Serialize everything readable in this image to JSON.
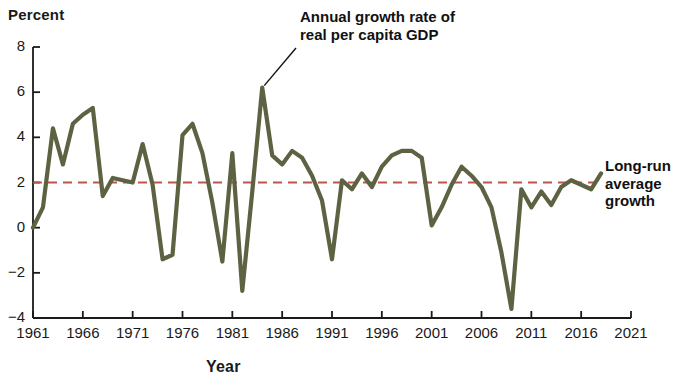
{
  "figure": {
    "ylabel": "Percent",
    "xlabel": "Year",
    "annotations": {
      "series_label": "Annual growth rate of\nreal per capita GDP",
      "average_label": "Long-run\naverage\ngrowth"
    },
    "colors": {
      "series_line": "#5d6342",
      "average_line": "#c0544a",
      "axis": "#1a1a1a",
      "background": "#ffffff",
      "text": "#111111"
    }
  },
  "chart_data": {
    "type": "line",
    "title": "",
    "xlabel": "Year",
    "ylabel": "Percent",
    "xlim": [
      1961,
      2021
    ],
    "ylim": [
      -4,
      8
    ],
    "yticks": [
      -4,
      -2,
      0,
      2,
      4,
      6,
      8
    ],
    "ytick_labels": [
      "−4",
      "−2",
      "0",
      "2",
      "4",
      "6",
      "8"
    ],
    "xticks": [
      1961,
      1966,
      1971,
      1976,
      1981,
      1986,
      1991,
      1996,
      2001,
      2006,
      2011,
      2016,
      2021
    ],
    "xtick_labels": [
      "1961",
      "1966",
      "1971",
      "1976",
      "1981",
      "1986",
      "1991",
      "1996",
      "2001",
      "2006",
      "2011",
      "2016",
      "2021"
    ],
    "grid": false,
    "legend": false,
    "series": [
      {
        "name": "Annual growth rate of real per capita GDP",
        "color": "#5d6342",
        "x": [
          1961,
          1962,
          1963,
          1964,
          1965,
          1966,
          1967,
          1968,
          1969,
          1970,
          1971,
          1972,
          1973,
          1974,
          1975,
          1976,
          1977,
          1978,
          1979,
          1980,
          1981,
          1982,
          1983,
          1984,
          1985,
          1986,
          1987,
          1988,
          1989,
          1990,
          1991,
          1992,
          1993,
          1994,
          1995,
          1996,
          1997,
          1998,
          1999,
          2000,
          2001,
          2002,
          2003,
          2004,
          2005,
          2006,
          2007,
          2008,
          2009,
          2010,
          2011,
          2012,
          2013,
          2014,
          2015,
          2016,
          2017,
          2018
        ],
        "y": [
          0.0,
          0.9,
          4.4,
          2.8,
          4.6,
          5.0,
          5.3,
          1.4,
          2.2,
          2.1,
          2.0,
          3.7,
          1.9,
          -1.4,
          -1.2,
          4.1,
          4.6,
          3.3,
          1.1,
          -1.5,
          3.3,
          -2.8,
          1.6,
          6.2,
          3.2,
          2.8,
          3.4,
          3.1,
          2.3,
          1.2,
          -1.4,
          2.1,
          1.7,
          2.4,
          1.8,
          2.7,
          3.2,
          3.4,
          3.4,
          3.1,
          0.1,
          0.9,
          1.9,
          2.7,
          2.3,
          1.8,
          0.9,
          -1.1,
          -3.6,
          1.7,
          0.9,
          1.6,
          1.0,
          1.8,
          2.1,
          1.9,
          1.7,
          2.4
        ]
      },
      {
        "name": "Long-run average growth",
        "color": "#c0544a",
        "style": "dashed",
        "constant": 2.0,
        "x": [
          1961,
          2018
        ],
        "y": [
          2.0,
          2.0
        ]
      }
    ]
  }
}
